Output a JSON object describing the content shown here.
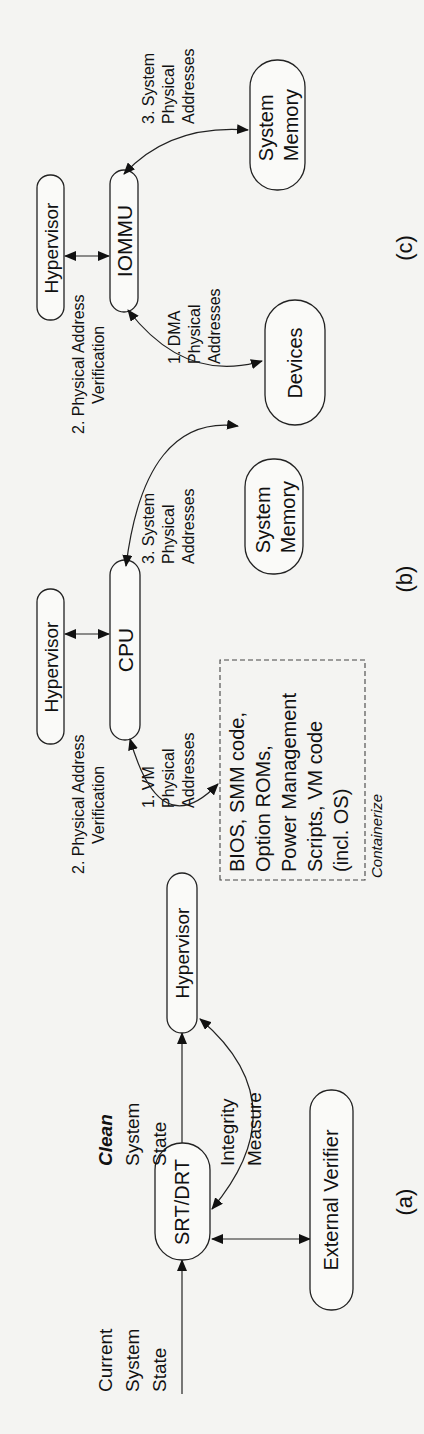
{
  "figure": {
    "panel_a": {
      "caption": "(a)",
      "input_label": [
        "Current",
        "System",
        "State"
      ],
      "node_srt": "SRT/DRT",
      "output_label_emph": "Clean",
      "output_label": [
        "System",
        "State"
      ],
      "node_hypervisor": "Hypervisor",
      "edge_integrity": [
        "Integrity",
        "Measure"
      ],
      "node_verifier": "External Verifier"
    },
    "panel_b": {
      "caption": "(b)",
      "node_hypervisor": "Hypervisor",
      "node_cpu": "CPU",
      "edge_verification": [
        "2. Physical Address",
        "Verification"
      ],
      "edge_vm": [
        "1. VM",
        "Physical",
        "Addresses"
      ],
      "edge_system": [
        "3. System",
        "Physical",
        "Addresses"
      ],
      "node_memory": [
        "System",
        "Memory"
      ],
      "container_lines": [
        "BIOS, SMM code,",
        "Option ROMs,",
        "Power Management",
        "Scripts, VM code",
        "(incl. OS)"
      ],
      "container_label": "Containerize"
    },
    "panel_c": {
      "caption": "(c)",
      "node_hypervisor": "Hypervisor",
      "node_iommu": "IOMMU",
      "edge_verification": [
        "2. Physical Address",
        "Verification"
      ],
      "edge_dma": [
        "1. DMA",
        "Physical",
        "Addresses"
      ],
      "edge_system": [
        "3. System",
        "Physical",
        "Addresses"
      ],
      "node_devices": "Devices",
      "node_memory": [
        "System",
        "Memory"
      ]
    }
  }
}
